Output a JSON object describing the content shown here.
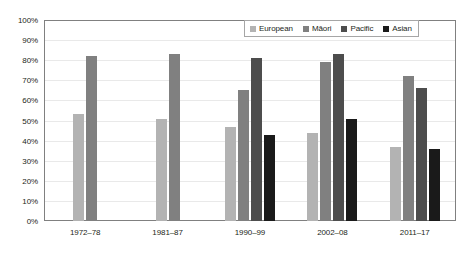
{
  "chart_data": {
    "type": "bar",
    "title": "",
    "xlabel": "",
    "ylabel": "",
    "ylim": [
      0,
      100
    ],
    "ytick_labels": [
      "100%",
      "90%",
      "80%",
      "70%",
      "60%",
      "50%",
      "40%",
      "30%",
      "20%",
      "10%",
      "0%"
    ],
    "ytick_values": [
      100,
      90,
      80,
      70,
      60,
      50,
      40,
      30,
      20,
      10,
      0
    ],
    "grid": true,
    "legend_position": "top-right-inside",
    "categories": [
      "1972–78",
      "1981–87",
      "1990–99",
      "2002–08",
      "2011–17"
    ],
    "series": [
      {
        "name": "European",
        "color": "#b3b3b3",
        "values": [
          53,
          51,
          47,
          44,
          37
        ]
      },
      {
        "name": "Māori",
        "color": "#808080",
        "values": [
          82,
          83,
          65,
          79,
          72
        ]
      },
      {
        "name": "Pacific",
        "color": "#4d4d4d",
        "values": [
          null,
          null,
          81,
          83,
          66
        ]
      },
      {
        "name": "Asian",
        "color": "#1a1a1a",
        "values": [
          null,
          null,
          43,
          51,
          36
        ]
      }
    ]
  },
  "legend": {
    "items": [
      {
        "label": "European"
      },
      {
        "label": "Māori"
      },
      {
        "label": "Pacific"
      },
      {
        "label": "Asian"
      }
    ]
  }
}
